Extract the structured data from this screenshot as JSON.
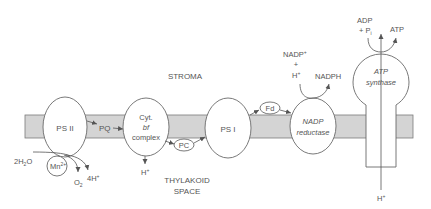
{
  "diagram": {
    "colors": {
      "membrane": "#d4d4d4",
      "stroke": "#6a6a6a",
      "text": "#555555",
      "background": "#ffffff"
    },
    "regions": {
      "stroma": "STROMA",
      "thylakoid_line1": "THYLAKOID",
      "thylakoid_line2": "SPACE"
    },
    "complexes": {
      "ps2": "PS II",
      "cyt_line1": "Cyt.",
      "cyt_line2": "bf",
      "cyt_line3": "complex",
      "ps1": "PS I",
      "nadp_line1": "NADP",
      "nadp_line2": "reductase",
      "atp_line1": "ATP",
      "atp_line2": "synthase"
    },
    "carriers": {
      "pq": "PQ",
      "pc": "PC",
      "fd": "Fd",
      "mn_base": "Mn",
      "mn_sup": "2+"
    },
    "molecules": {
      "water_pre": "2H",
      "water_sub": "2",
      "water_post": "O",
      "o2_base": "O",
      "o2_sub": "2",
      "protons_4": "4H",
      "h_plus_base": "H",
      "plus_sup": "+",
      "nadp_plus_base": "NADP",
      "plus_sign": "+",
      "nadph": "NADPH",
      "adp": "ADP",
      "pi_prefix": "+ P",
      "pi_sub": "i",
      "atp": "ATP"
    }
  }
}
